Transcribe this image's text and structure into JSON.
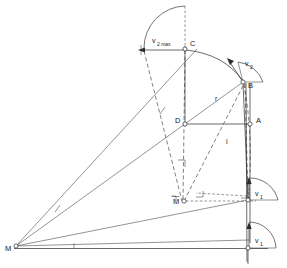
{
  "figure": {
    "type": "kinematic-mechanism-diagram",
    "background_color": "#ffffff",
    "line_color": "#2b2b2b",
    "width": 287,
    "height": 268
  },
  "points": {
    "M": "M",
    "M_bar": "M",
    "A": "A",
    "B": "B",
    "C": "C",
    "D": "D"
  },
  "labels": {
    "v2max_base": "v",
    "v2max_sub": "2 max",
    "v2_base": "v",
    "v2_sub": "2",
    "v1_upper_base": "v",
    "v1_upper_sub": "1",
    "v1_lower_base": "v",
    "v1_lower_sub": "1",
    "radius": "r",
    "length": "l"
  },
  "annotations": {
    "overbar": "¯",
    "right_angle_marks": 4,
    "tick_marks": 3
  }
}
